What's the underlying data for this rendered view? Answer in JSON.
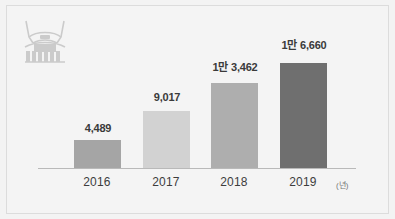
{
  "figure": {
    "background_color": "#f3f3f3",
    "frame_color": "#dcdcdc",
    "icon_name": "structure-emblem-icon",
    "icon_color": "#cfcfcf"
  },
  "chart_data": {
    "type": "bar",
    "title": "",
    "xlabel": "(년)",
    "ylabel": "",
    "categories": [
      "2016",
      "2017",
      "2018",
      "2019"
    ],
    "values": [
      4489,
      9017,
      13462,
      16660
    ],
    "value_labels": [
      "4,489",
      "9,017",
      "1만 3,462",
      "1만 6,660"
    ],
    "bar_colors": [
      "#a5a5a5",
      "#d2d2d2",
      "#aeaeae",
      "#6f6f6f"
    ],
    "ylim": [
      0,
      18500
    ],
    "grid": false,
    "legend": null,
    "axis_line_color": "#b9b9b9",
    "unit_note": "(년)"
  }
}
